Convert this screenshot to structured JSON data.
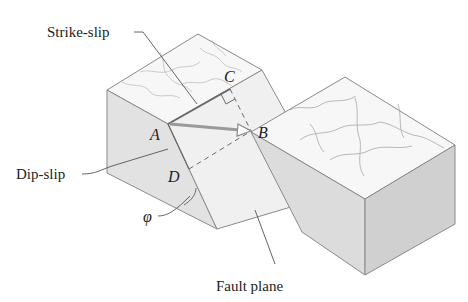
{
  "figure": {
    "labels": {
      "strike_slip": "Strike-slip",
      "dip_slip": "Dip-slip",
      "fault_plane": "Fault plane",
      "angle": "φ"
    },
    "points": {
      "A": "A",
      "B": "B",
      "C": "C",
      "D": "D"
    },
    "colors": {
      "top_surface": "#f7f7f7",
      "side_face": "#e4e4e4",
      "side_face_dark": "#d6d6d6",
      "fault_plane": "#efefef",
      "edge": "#8a8a8a",
      "slip_line": "#6a6a6a",
      "arrow": "#9a9a9a"
    }
  }
}
